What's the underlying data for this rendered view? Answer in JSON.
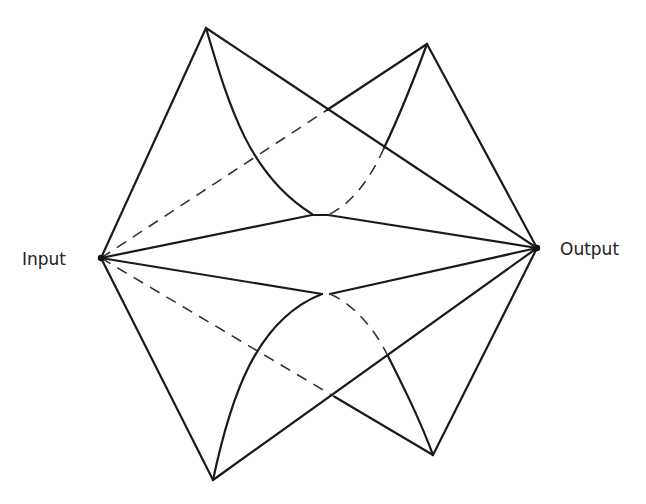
{
  "labels": {
    "input": "Input",
    "output": "Output"
  },
  "colors": {
    "background": "#ffffff",
    "stroke": "#1a1a1a"
  },
  "nodes": [
    {
      "id": "input",
      "x": 101,
      "y": 258
    },
    {
      "id": "output",
      "x": 537,
      "y": 248
    },
    {
      "id": "top-left",
      "x": 206,
      "y": 28
    },
    {
      "id": "top-right",
      "x": 427,
      "y": 44
    },
    {
      "id": "upper-center",
      "x": 318,
      "y": 215
    },
    {
      "id": "lower-center",
      "x": 325,
      "y": 294
    },
    {
      "id": "bottom-left",
      "x": 213,
      "y": 480
    },
    {
      "id": "bottom-right",
      "x": 433,
      "y": 455
    }
  ],
  "edges": [
    {
      "name": "input-to-top-left",
      "d": "M101 258 L206 28",
      "style": "solid"
    },
    {
      "name": "top-left-to-output",
      "d": "M206 28 L537 248",
      "style": "solid"
    },
    {
      "name": "top-left-to-upper-center-curve",
      "d": "M206 28 C230 110 250 175 312 214",
      "style": "solid"
    },
    {
      "name": "input-to-top-right-hidden",
      "d": "M101 258 L327 110",
      "style": "dashed"
    },
    {
      "name": "input-to-top-right-visible",
      "d": "M327 110 L427 44",
      "style": "solid"
    },
    {
      "name": "top-right-to-output",
      "d": "M427 44 L537 248",
      "style": "solid"
    },
    {
      "name": "top-right-curve-visible",
      "d": "M427 44 C410 90 395 125 384 148",
      "style": "solid"
    },
    {
      "name": "top-right-curve-hidden",
      "d": "M384 148 C370 180 350 205 328 215",
      "style": "dashed"
    },
    {
      "name": "input-to-upper-center",
      "d": "M101 258 L312 215",
      "style": "solid"
    },
    {
      "name": "upper-center-bar",
      "d": "M312 215 L328 215",
      "style": "solid"
    },
    {
      "name": "upper-center-to-output",
      "d": "M328 215 L537 248",
      "style": "solid"
    },
    {
      "name": "input-to-lower-center",
      "d": "M101 258 L322 294",
      "style": "solid"
    },
    {
      "name": "lower-center-to-output",
      "d": "M330 294 L537 248",
      "style": "solid"
    },
    {
      "name": "input-to-bottom-left",
      "d": "M101 258 L213 480",
      "style": "solid"
    },
    {
      "name": "bottom-left-to-lower-center-curve",
      "d": "M213 480 C230 400 255 320 322 294",
      "style": "solid"
    },
    {
      "name": "bottom-left-to-output",
      "d": "M213 480 L537 248",
      "style": "solid"
    },
    {
      "name": "input-to-bottom-right-hidden",
      "d": "M101 258 L335 397",
      "style": "dashed"
    },
    {
      "name": "input-to-bottom-right-visible",
      "d": "M335 397 L433 455",
      "style": "solid"
    },
    {
      "name": "lower-center-curve-hidden",
      "d": "M330 294 C355 305 375 330 388 356",
      "style": "dashed"
    },
    {
      "name": "lower-center-curve-visible",
      "d": "M388 356 C405 390 420 420 433 455",
      "style": "solid"
    },
    {
      "name": "bottom-right-to-output",
      "d": "M433 455 L537 248",
      "style": "solid"
    }
  ]
}
